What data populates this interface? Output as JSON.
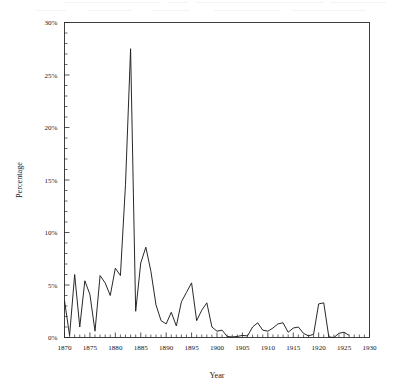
{
  "figure": {
    "axis_label_x": "Year",
    "axis_label_y": "Percentage",
    "line_color": "#1c1c1c",
    "axis_color": "#2b2b2b",
    "background_color": "#ffffff"
  },
  "chart_data": {
    "type": "line",
    "title": "",
    "xlabel": "Year",
    "ylabel": "Percentage",
    "xlim": [
      1870,
      1930
    ],
    "ylim": [
      0,
      30
    ],
    "grid": false,
    "legend": null,
    "x_tick_labels": [
      "1870",
      "1875",
      "1880",
      "1885",
      "1890",
      "1895",
      "1900",
      "1905",
      "1910",
      "1915",
      "1920",
      "1925",
      "1930"
    ],
    "x_ticks": [
      1870,
      1875,
      1880,
      1885,
      1890,
      1895,
      1900,
      1905,
      1910,
      1915,
      1920,
      1925,
      1930
    ],
    "x_minor_tick_step": 1,
    "y_tick_labels": [
      "0%",
      "5%",
      "10%",
      "15%",
      "20%",
      "25%",
      "30%"
    ],
    "y_ticks": [
      0,
      5,
      10,
      15,
      20,
      25,
      30
    ],
    "y_minor_tick_step": 1,
    "y_unit": "%",
    "x": [
      1870,
      1871,
      1872,
      1873,
      1874,
      1875,
      1876,
      1877,
      1878,
      1879,
      1880,
      1881,
      1882,
      1883,
      1884,
      1885,
      1886,
      1887,
      1888,
      1889,
      1890,
      1891,
      1892,
      1893,
      1894,
      1895,
      1896,
      1897,
      1898,
      1899,
      1900,
      1901,
      1902,
      1903,
      1904,
      1905,
      1906,
      1907,
      1908,
      1909,
      1910,
      1911,
      1912,
      1913,
      1914,
      1915,
      1916,
      1917,
      1918,
      1919,
      1920,
      1921,
      1922,
      1923,
      1924,
      1925,
      1926
    ],
    "values": [
      3.5,
      0.2,
      6.0,
      1.0,
      5.4,
      4.1,
      0.6,
      5.9,
      5.2,
      4.0,
      6.6,
      5.9,
      14.6,
      27.5,
      2.5,
      7.1,
      8.6,
      6.3,
      3.1,
      1.6,
      1.3,
      2.4,
      1.1,
      3.4,
      4.3,
      5.2,
      1.6,
      2.6,
      3.3,
      1.0,
      0.6,
      0.7,
      0.1,
      0.05,
      0.1,
      0.2,
      0.15,
      1.0,
      1.4,
      0.7,
      0.6,
      0.9,
      1.3,
      1.4,
      0.5,
      0.9,
      1.0,
      0.4,
      0.15,
      0.3,
      3.2,
      3.3,
      0.05,
      0.0,
      0.4,
      0.5,
      0.2
    ],
    "series": [
      {
        "name": "Percentage",
        "values": [
          3.5,
          0.2,
          6.0,
          1.0,
          5.4,
          4.1,
          0.6,
          5.9,
          5.2,
          4.0,
          6.6,
          5.9,
          14.6,
          27.5,
          2.5,
          7.1,
          8.6,
          6.3,
          3.1,
          1.6,
          1.3,
          2.4,
          1.1,
          3.4,
          4.3,
          5.2,
          1.6,
          2.6,
          3.3,
          1.0,
          0.6,
          0.7,
          0.1,
          0.05,
          0.1,
          0.2,
          0.15,
          1.0,
          1.4,
          0.7,
          0.6,
          0.9,
          1.3,
          1.4,
          0.5,
          0.9,
          1.0,
          0.4,
          0.15,
          0.3,
          3.2,
          3.3,
          0.05,
          0.0,
          0.4,
          0.5,
          0.2
        ]
      }
    ],
    "annotations": [
      {
        "label": "peak",
        "x": 1881,
        "y": 27.5
      }
    ]
  }
}
